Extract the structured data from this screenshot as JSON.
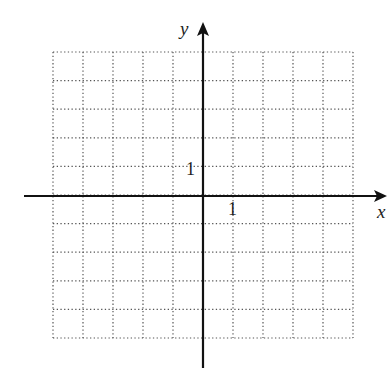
{
  "chart_data": {
    "type": "scatter",
    "title": "",
    "xlabel": "x",
    "ylabel": "y",
    "xlim": [
      -5,
      5
    ],
    "ylim": [
      -5,
      5
    ],
    "grid": true,
    "grid_style": "dotted",
    "grid_step": 1,
    "tick_labels": {
      "x": [
        "1"
      ],
      "y": [
        "1"
      ]
    },
    "series": [],
    "legend": null
  },
  "colors": {
    "axis": "#111111",
    "grid": "#555555",
    "background": "#ffffff"
  },
  "labels": {
    "x_axis": "x",
    "y_axis": "y",
    "x_tick_1": "1",
    "y_tick_1": "1"
  }
}
